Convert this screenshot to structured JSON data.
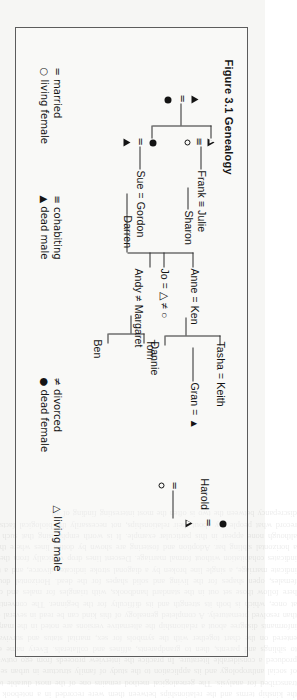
{
  "figure": {
    "title": "Figure 3.1 Genealogy",
    "caption_number": "3.1",
    "caption_text": "Genealogy"
  },
  "tree": {
    "generation1": {
      "couple_symbols": "▲ = ●",
      "left_symbol": "▲",
      "relation_symbol": "=",
      "right_symbol": "●"
    },
    "unions": [
      {
        "id": "frank-julie",
        "name_label": "Frank ≡ Julie",
        "symbol_label": "○ ≡ △",
        "left_name": "Frank",
        "right_name": "Julie",
        "relation": "≡",
        "left_symbol": "○",
        "right_symbol": "△",
        "children": [
          "Sharon"
        ]
      },
      {
        "id": "sue-gordon",
        "name_label": "Sue = Gordon",
        "symbol_label": "● = ▲",
        "left_name": "Sue",
        "right_name": "Gordon",
        "relation": "=",
        "left_symbol": "●",
        "right_symbol": "▲",
        "children": [
          "Darren"
        ]
      },
      {
        "id": "jo-couple",
        "name_label": "Jo = △ ≠ ○",
        "symbol_label": "Jo = △ ≠ ○",
        "left_name": "Jo",
        "relation": "=",
        "second_relation": "≠",
        "left_symbol": "△",
        "right_symbol": "○",
        "children": []
      },
      {
        "id": "andy-margaret",
        "name_label": "Andy ≠ Margaret",
        "left_name": "Andy",
        "right_name": "Margaret",
        "relation": "≠",
        "children": [
          "Ben",
          "Tom"
        ]
      },
      {
        "id": "gran-couple",
        "name_label": "Gran = ▲",
        "symbol_label": "Gran = ▲",
        "left_name": "Gran",
        "relation": "=",
        "right_symbol": "▲",
        "children": []
      },
      {
        "id": "anne-ken",
        "name_label": "Anne = Ken",
        "left_name": "Anne",
        "right_name": "Ken",
        "relation": "=",
        "children": [
          "Dannie",
          "Tasha"
        ]
      },
      {
        "id": "tasha-keith",
        "name_label": "Tasha = Keith",
        "left_name": "Tasha",
        "right_name": "Keith",
        "relation": "=",
        "children": []
      },
      {
        "id": "harold-couple",
        "name_label": "○ = Harold",
        "left_symbol": "○",
        "relation": "=",
        "right_name": "Harold",
        "children": []
      },
      {
        "id": "harold-parents",
        "name_label": "△ = ●",
        "left_symbol": "△",
        "relation": "=",
        "right_symbol": "●",
        "children": [
          "Harold"
        ]
      }
    ],
    "persons": [
      "Frank",
      "Julie",
      "Sharon",
      "Sue",
      "Gordon",
      "Darren",
      "Jo",
      "Andy",
      "Margaret",
      "Ben",
      "Tom",
      "Gran",
      "Anne",
      "Ken",
      "Dannie",
      "Tasha",
      "Keith",
      "Harold"
    ]
  },
  "legend": {
    "columns": [
      {
        "id": "col-1",
        "entries": [
          {
            "symbol": "=",
            "label": "married",
            "text": "= married"
          },
          {
            "symbol": "○",
            "label": "living female",
            "text": "○ living female"
          }
        ]
      },
      {
        "id": "col-2",
        "entries": [
          {
            "symbol": "≡",
            "label": "cohabiting",
            "text": "≡ cohabiting"
          },
          {
            "symbol": "▲",
            "label": "dead male",
            "text": "▲ dead male"
          }
        ]
      },
      {
        "id": "col-3",
        "entries": [
          {
            "symbol": "≠",
            "label": "divorced",
            "text": "≠ divorced"
          },
          {
            "symbol": "●",
            "label": "dead female",
            "text": "● dead female"
          }
        ]
      },
      {
        "id": "col-4",
        "entries": [
          {
            "symbol": "△",
            "label": "living male",
            "text": "△ living male"
          }
        ]
      }
    ]
  },
  "colors": {
    "paper": "#f6f6f4",
    "ink": "#141414",
    "frame": "#5c5c5c",
    "rule": "#2a2a2a"
  },
  "bleed_text": "the kinship terms and the relationships between them were recorded in a notebook and later transcribed for analysis. The genealogical method remains one of the most durable techniques of social anthropology and its application to the study of family structure in urban settings has produced a considerable literature. In practice the interview proceeds from ego outwards, first to siblings and parents, then to grandparents, affines and collaterals. Every name elicited is entered on the chart together with the symbols for sex, marital status and survival. Where informants disagree about a relationship the alternative versions are noted in the margin rather than resolved prematurely. A completed genealogy of this kind can be read in several directions at once, which is both its strength and its difficulty for the beginner. The conventions used here follow those set out in the standard handbooks, with triangles for males and circles for females, open shapes for the living and solid shapes for the dead. Horizontal double lines indicate marriage, a single line broken by a diagonal stroke indicates divorce, and a triple line indicates cohabitation without formal marriage. Descent lines drop vertically from the union to a horizontal sibling bar. Adoption and fostering are shown by dotted lines where they occur, although none appear in this particular example. It is worth emphasising that such diagrams record what people say about their relationships, not necessarily the biological facts, and the discrepancy between the two is often the most interesting finding of all."
}
